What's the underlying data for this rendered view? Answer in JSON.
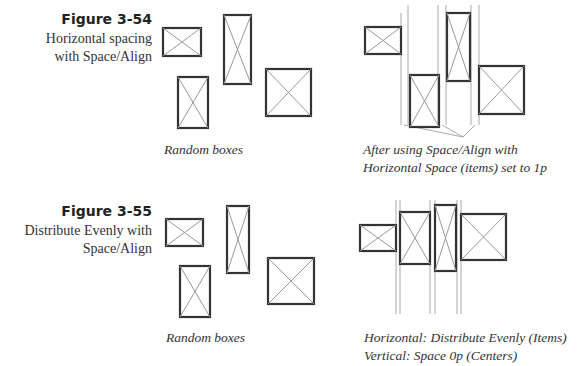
{
  "figures": [
    {
      "label": "Figure 3-54",
      "description_lines": [
        "Horizontal spacing",
        "with Space/Align"
      ],
      "left_caption": "Random boxes",
      "right_caption_lines": [
        "After using Space/Align with",
        "Horizontal Space (items) set to 1p"
      ]
    },
    {
      "label": "Figure 3-55",
      "description_lines": [
        "Distribute Evenly with",
        "Space/Align"
      ],
      "left_caption": "Random boxes",
      "right_caption_lines": [
        "Horizontal: Distribute Evenly (Items)",
        "Vertical: Space 0p (Centers)"
      ]
    }
  ],
  "colors": {
    "box_stroke": "#333333",
    "cross_stroke": "#999999",
    "guide_stroke": "#aaaaaa",
    "text": "#333333"
  }
}
